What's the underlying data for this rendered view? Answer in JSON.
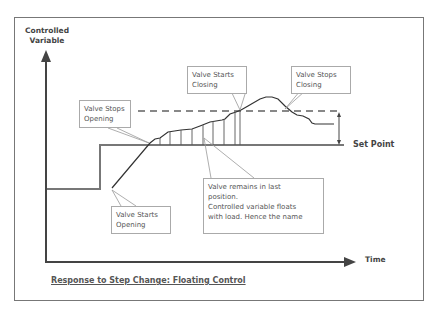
{
  "diagram": {
    "title": "Response to Step Change:  Floating Control",
    "y_axis_label_line1": "Controlled",
    "y_axis_label_line2": "Variable",
    "x_axis_label": "Time",
    "set_point_label": "Set Point",
    "callouts": {
      "valve_stops_opening": [
        "Valve Stops",
        "Opening"
      ],
      "valve_starts_closing": [
        "Valve Starts",
        "Closing"
      ],
      "valve_stops_closing": [
        "Valve Stops",
        "Closing"
      ],
      "valve_starts_opening": [
        "Valve Starts",
        "Opening"
      ],
      "valve_remains": [
        "Valve remains in last",
        "position.",
        "Controlled variable floats",
        "with load.  Hence the name"
      ]
    },
    "colors": {
      "axis": "#444444",
      "set_point_line": "#777777",
      "curve": "#333333",
      "dashed_line": "#888888",
      "callout_border": "#aaaaaa"
    }
  }
}
